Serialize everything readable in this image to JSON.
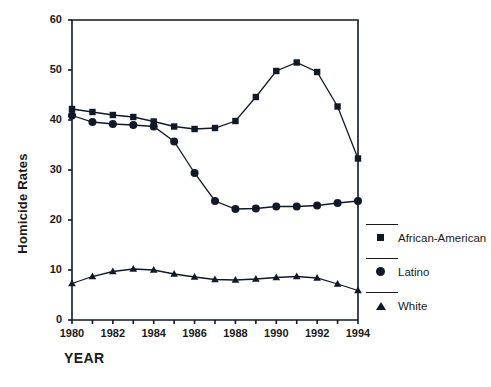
{
  "chart_data": {
    "type": "line",
    "title": "",
    "xlabel": "YEAR",
    "ylabel": "Homicide Rates",
    "xlim": [
      1980,
      1994
    ],
    "ylim": [
      0,
      60
    ],
    "ytick_values": [
      0,
      10,
      20,
      30,
      40,
      50,
      60
    ],
    "ytick_labels": [
      "0",
      "10",
      "20",
      "30",
      "40",
      "50",
      "60"
    ],
    "xtick_values": [
      1980,
      1982,
      1984,
      1986,
      1988,
      1990,
      1992,
      1994
    ],
    "xtick_labels": [
      "1980",
      "1982",
      "1984",
      "1986",
      "1988",
      "1990",
      "1992",
      "1994"
    ],
    "minor_xticks": [
      1981,
      1983,
      1985,
      1987,
      1989,
      1991,
      1993
    ],
    "grid": false,
    "legend_position": "right",
    "x": [
      1980,
      1981,
      1982,
      1983,
      1984,
      1985,
      1986,
      1987,
      1988,
      1989,
      1990,
      1991,
      1992,
      1993,
      1994
    ],
    "series": [
      {
        "name": "African-American",
        "marker": "square",
        "color": "#111827",
        "values": [
          42.2,
          41.6,
          41.0,
          40.6,
          39.7,
          38.7,
          38.2,
          38.4,
          39.8,
          44.6,
          49.8,
          51.5,
          49.6,
          42.7,
          32.3
        ]
      },
      {
        "name": "Latino",
        "marker": "circle",
        "color": "#111827",
        "values": [
          40.9,
          39.6,
          39.2,
          39.0,
          38.7,
          35.7,
          29.4,
          23.8,
          22.2,
          22.3,
          22.7,
          22.7,
          22.9,
          23.4,
          23.8
        ]
      },
      {
        "name": "White",
        "marker": "triangle",
        "color": "#111827",
        "values": [
          7.3,
          8.7,
          9.7,
          10.2,
          10.0,
          9.2,
          8.6,
          8.1,
          8.0,
          8.2,
          8.5,
          8.7,
          8.4,
          7.2,
          5.9
        ]
      }
    ]
  },
  "legend": {
    "items": [
      {
        "label": "African-American",
        "marker": "square-marker"
      },
      {
        "label": "Latino",
        "marker": "circle-marker"
      },
      {
        "label": "White",
        "marker": "triangle-marker"
      }
    ]
  },
  "axes": {
    "x_axis_title": "YEAR",
    "y_axis_title": "Homicide Rates"
  }
}
